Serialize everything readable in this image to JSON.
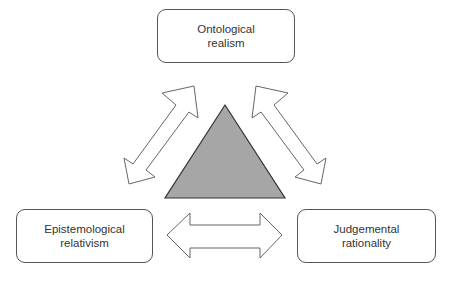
{
  "diagram": {
    "type": "triangular-relationship-diagram",
    "nodes": [
      {
        "id": "top",
        "lines": [
          "Ontological",
          "realism"
        ]
      },
      {
        "id": "left",
        "lines": [
          "Epistemological",
          "relativism"
        ]
      },
      {
        "id": "right",
        "lines": [
          "Judgemental",
          "rationality"
        ]
      }
    ],
    "center_shape": {
      "shape": "triangle",
      "fill": "#a6a6a6",
      "stroke": "#333333"
    },
    "edges": [
      {
        "from": "top",
        "to": "left",
        "style": "double-headed-hollow-arrow"
      },
      {
        "from": "top",
        "to": "right",
        "style": "double-headed-hollow-arrow"
      },
      {
        "from": "left",
        "to": "right",
        "style": "double-headed-hollow-arrow"
      }
    ],
    "colors": {
      "box_border": "#555555",
      "arrow_stroke": "#666666",
      "text": "#333333"
    }
  }
}
